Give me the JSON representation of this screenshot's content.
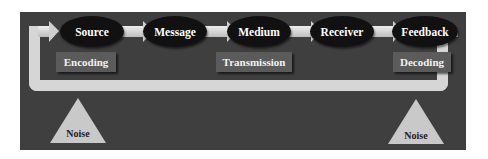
{
  "diagram": {
    "nodes": [
      {
        "label": "Source"
      },
      {
        "label": "Message"
      },
      {
        "label": "Medium"
      },
      {
        "label": "Receiver"
      },
      {
        "label": "Feedback"
      }
    ],
    "stages": [
      {
        "label": "Encoding"
      },
      {
        "label": "Transmission"
      },
      {
        "label": "Decoding"
      }
    ],
    "noise": [
      {
        "label": "Noise"
      },
      {
        "label": "Noise"
      }
    ],
    "colors": {
      "panel": "#3f3f3f",
      "node": "#111111",
      "stage_box": "#5b5b5b",
      "arrow": "#d6d6d6",
      "noise": "#c9c9c9"
    }
  }
}
